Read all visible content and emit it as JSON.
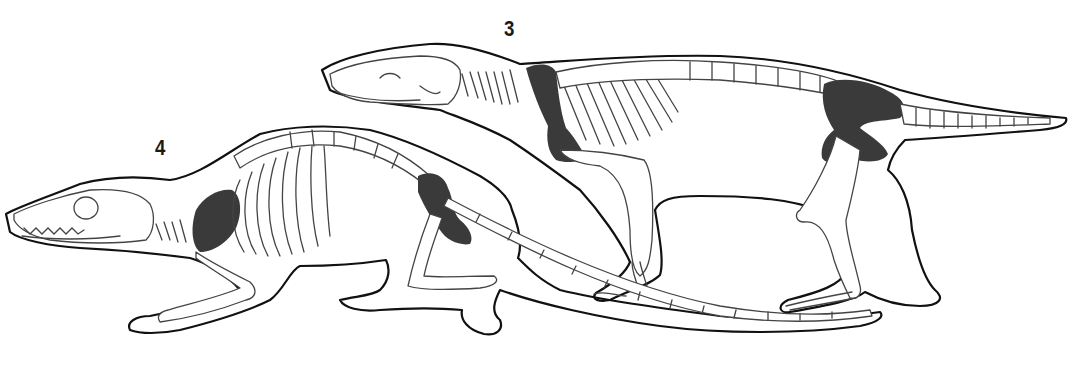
{
  "figure": {
    "type": "skeletal-reconstruction-illustration",
    "specimens": [
      {
        "label": "3",
        "description": "elongate-bodied mammal skeleton in body outline, walking posture, long tapering tail; shoulder girdle and pelvis shaded dark"
      },
      {
        "label": "4",
        "description": "rat-like mammal skeleton in body outline, crouched posture, very long thin tail; scapula and pelvis shaded dark"
      }
    ],
    "colors": {
      "background": "#ffffff",
      "outline": "#111111",
      "bone_stroke": "#444444",
      "highlight_fill": "#3a3a3a"
    }
  }
}
